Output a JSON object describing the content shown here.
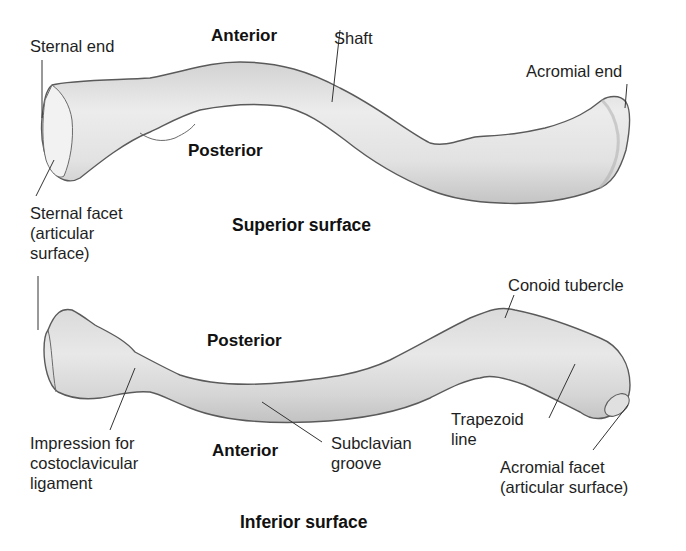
{
  "figure": {
    "panels": [
      {
        "title": "Superior surface",
        "orientation_labels": {
          "top": "Anterior",
          "bottom": "Posterior"
        },
        "callouts": [
          {
            "id": "sternal-end",
            "text": "Sternal end"
          },
          {
            "id": "shaft",
            "text": "Shaft"
          },
          {
            "id": "acromial-end",
            "text": "Acromial end"
          },
          {
            "id": "sternal-facet",
            "text": "Sternal facet\n(articular\nsurface)"
          }
        ]
      },
      {
        "title": "Inferior surface",
        "orientation_labels": {
          "top": "Posterior",
          "bottom": "Anterior"
        },
        "callouts": [
          {
            "id": "conoid-tubercle",
            "text": "Conoid tubercle"
          },
          {
            "id": "impression-costoclavicular",
            "text": "Impression for\ncostoclavicular\nligament"
          },
          {
            "id": "subclavian-groove",
            "text": "Subclavian\ngroove"
          },
          {
            "id": "trapezoid-line",
            "text": "Trapezoid\nline"
          },
          {
            "id": "acromial-facet",
            "text": "Acromial facet\n(articular surface)"
          }
        ]
      }
    ],
    "colors": {
      "bone_fill": "#e4e4e4",
      "bone_shade": "#c9c9c9",
      "bone_outline": "#5a5a5a",
      "leader_line": "#333333",
      "text": "#1e1e1e"
    }
  }
}
